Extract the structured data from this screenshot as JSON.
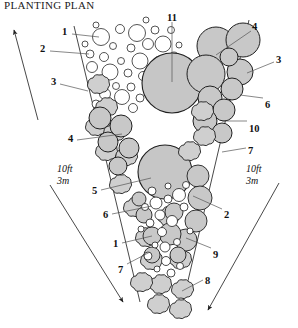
{
  "title": "PLANTING PLAN",
  "colors": {
    "tree_fill": "#c8c8c8",
    "shrub_fill": "#d0d0d0",
    "ground_fill": "#ffffff",
    "outline": "#1a1a1a",
    "leader": "#555555",
    "text": "#111111",
    "background": "#ffffff"
  },
  "scale_left": {
    "feet": "10ft",
    "meters": "3m"
  },
  "scale_right": {
    "feet": "10ft",
    "meters": "3m"
  },
  "callouts": [
    {
      "id": "c1",
      "label": "1",
      "x": 62,
      "y": 27,
      "lx1": 72,
      "ly1": 34,
      "lx2": 99,
      "ly2": 37
    },
    {
      "id": "c2",
      "label": "2",
      "x": 40,
      "y": 44,
      "lx1": 50,
      "ly1": 51,
      "lx2": 89,
      "ly2": 54
    },
    {
      "id": "c3",
      "label": "3",
      "x": 51,
      "y": 77,
      "lx1": 60,
      "ly1": 84,
      "lx2": 88,
      "ly2": 91
    },
    {
      "id": "c4",
      "label": "4",
      "x": 68,
      "y": 134,
      "lx1": 77,
      "ly1": 140,
      "lx2": 122,
      "ly2": 134
    },
    {
      "id": "c5",
      "label": "5",
      "x": 92,
      "y": 186,
      "lx1": 101,
      "ly1": 190,
      "lx2": 151,
      "ly2": 178
    },
    {
      "id": "c6",
      "label": "6",
      "x": 103,
      "y": 210,
      "lx1": 112,
      "ly1": 214,
      "lx2": 152,
      "ly2": 206
    },
    {
      "id": "c1b",
      "label": "1",
      "x": 113,
      "y": 239,
      "lx1": 122,
      "ly1": 243,
      "lx2": 152,
      "ly2": 236
    },
    {
      "id": "c7",
      "label": "7",
      "x": 118,
      "y": 265,
      "lx1": 127,
      "ly1": 264,
      "lx2": 150,
      "ly2": 252
    },
    {
      "id": "c11",
      "label": "11",
      "x": 167,
      "y": 13,
      "lx1": 172,
      "ly1": 22,
      "lx2": 172,
      "ly2": 82
    },
    {
      "id": "c4b",
      "label": "4",
      "x": 252,
      "y": 22,
      "lx1": 251,
      "ly1": 31,
      "lx2": 216,
      "ly2": 55
    },
    {
      "id": "c3b",
      "label": "3",
      "x": 276,
      "y": 55,
      "lx1": 274,
      "ly1": 62,
      "lx2": 247,
      "ly2": 73
    },
    {
      "id": "c6b",
      "label": "6",
      "x": 265,
      "y": 100,
      "lx1": 263,
      "ly1": 98,
      "lx2": 240,
      "ly2": 95
    },
    {
      "id": "c10",
      "label": "10",
      "x": 249,
      "y": 124,
      "lx1": 247,
      "ly1": 121,
      "lx2": 222,
      "ly2": 121
    },
    {
      "id": "c7b",
      "label": "7",
      "x": 248,
      "y": 146,
      "lx1": 246,
      "ly1": 148,
      "lx2": 222,
      "ly2": 152
    },
    {
      "id": "c2b",
      "label": "2",
      "x": 224,
      "y": 210,
      "lx1": 222,
      "ly1": 209,
      "lx2": 193,
      "ly2": 196
    },
    {
      "id": "c9",
      "label": "9",
      "x": 213,
      "y": 250,
      "lx1": 211,
      "ly1": 248,
      "lx2": 186,
      "ly2": 238
    },
    {
      "id": "c8",
      "label": "8",
      "x": 205,
      "y": 276,
      "lx1": 203,
      "ly1": 280,
      "lx2": 182,
      "ly2": 291
    }
  ],
  "arrows": [
    {
      "id": "arrow-upper-left",
      "x1": 38,
      "y1": 120,
      "x2": 14,
      "y2": 30
    },
    {
      "id": "arrow-lower-left",
      "x1": 50,
      "y1": 185,
      "x2": 123,
      "y2": 302
    },
    {
      "id": "arrow-lower-right",
      "x1": 279,
      "y1": 183,
      "x2": 208,
      "y2": 310
    }
  ],
  "bed_outline": {
    "left_edge": [
      [
        74,
        28
      ],
      [
        140,
        300
      ]
    ],
    "right_edge": [
      [
        248,
        22
      ],
      [
        183,
        300
      ]
    ]
  },
  "legend_numbers": [
    "1",
    "2",
    "3",
    "4",
    "5",
    "6",
    "7",
    "8",
    "9",
    "10",
    "11"
  ],
  "plant_groups": {
    "groundcover_circles": "small open circles, upper-left quadrant",
    "trees": "large gray filled circles",
    "shrubs": "gray scalloped cloud outlines",
    "massing": "medium gray circles clustered lower-center"
  }
}
